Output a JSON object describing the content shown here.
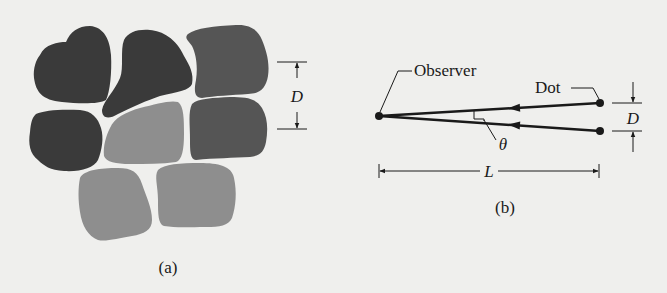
{
  "figure": {
    "background": "#efefed",
    "panel_a": {
      "caption": "(a)",
      "dimension_label": "D",
      "colors": {
        "dark": "#3a3a3a",
        "medium": "#555555",
        "light": "#8e8e8e"
      },
      "blobs": [
        {
          "name": "top-left",
          "shade": "dark"
        },
        {
          "name": "top-middle",
          "shade": "dark"
        },
        {
          "name": "top-right",
          "shade": "medium"
        },
        {
          "name": "middle-left",
          "shade": "dark"
        },
        {
          "name": "middle-center",
          "shade": "light"
        },
        {
          "name": "middle-right",
          "shade": "medium"
        },
        {
          "name": "bottom-left",
          "shade": "light"
        },
        {
          "name": "bottom-right",
          "shade": "light"
        }
      ]
    },
    "panel_b": {
      "caption": "(b)",
      "observer_label": "Observer",
      "dot_label": "Dot",
      "angle_label": "θ",
      "distance_label": "L",
      "separation_label": "D"
    }
  }
}
